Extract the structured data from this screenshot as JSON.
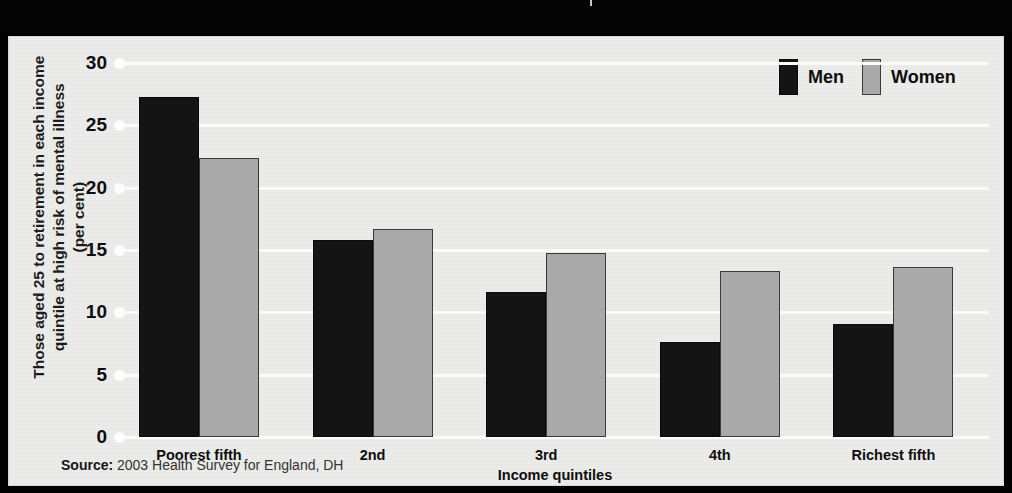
{
  "header": {
    "title": "incomes.",
    "divider": "vertical-rule"
  },
  "legend": {
    "position": "top-right",
    "items": [
      {
        "label": "Men",
        "color": "#141414"
      },
      {
        "label": "Women",
        "color": "#a9a9a9"
      }
    ]
  },
  "source": {
    "prefix": "Source:",
    "text": " 2003 Health Survey for England, DH"
  },
  "chart_data": {
    "type": "bar",
    "title": "",
    "categories": [
      "Poorest fifth",
      "2nd",
      "3rd",
      "4th",
      "Richest fifth"
    ],
    "series": [
      {
        "name": "Men",
        "color": "#141414",
        "values": [
          27.3,
          15.8,
          11.6,
          7.6,
          9.1
        ]
      },
      {
        "name": "Women",
        "color": "#a9a9a9",
        "values": [
          22.4,
          16.7,
          14.8,
          13.3,
          13.6
        ]
      }
    ],
    "xlabel": "Income quintiles",
    "ylabel": "Those aged 25 to retirement in each income quintile at high risk of mental illness (per cent)",
    "ylabel_line1": "Those aged 25 to retirement in each income",
    "ylabel_line2": "quintile at high risk of mental illness",
    "ylabel_line3": "(per cent)",
    "yticks": [
      0,
      5,
      10,
      15,
      20,
      25,
      30
    ],
    "ylim": [
      0,
      30
    ],
    "grid": true,
    "grid_color": "#fbfbfa",
    "background": "#eeeeec"
  }
}
